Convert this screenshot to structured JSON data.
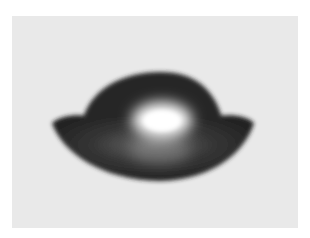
{
  "image": {
    "subject": "dark glossy droplet-like object with dome top and flared wings, bright central highlight",
    "background_color": "#e9e9e9",
    "border_color": "#ffffff",
    "object_color": "#2a2a2a",
    "highlight_color": "#ffffff"
  }
}
